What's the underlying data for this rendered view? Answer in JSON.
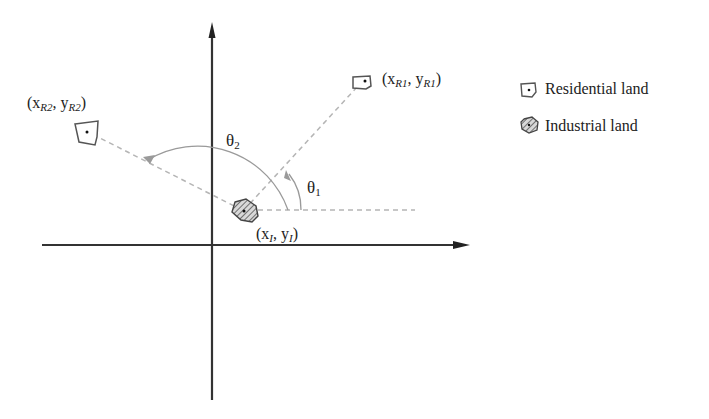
{
  "diagram": {
    "type": "coordinate-angle-diagram",
    "points": {
      "industrial": {
        "x_label": "x",
        "x_sub": "I",
        "y_label": "y",
        "y_sub": "I"
      },
      "residential_1": {
        "x_label": "x",
        "x_sub": "R1",
        "y_label": "y",
        "y_sub": "R1"
      },
      "residential_2": {
        "x_label": "x",
        "x_sub": "R2",
        "y_label": "y",
        "y_sub": "R2"
      }
    },
    "angles": {
      "theta1": {
        "symbol": "θ",
        "sub": "1"
      },
      "theta2": {
        "symbol": "θ",
        "sub": "2"
      }
    },
    "punct": {
      "open": "(",
      "comma": ", ",
      "close": ")"
    },
    "legend": {
      "items": [
        {
          "icon": "residential-land-icon",
          "label": "Residential land"
        },
        {
          "icon": "industrial-land-icon",
          "label": "Industrial land"
        }
      ]
    },
    "colors": {
      "axis": "#333333",
      "dashed": "#b5b5b5",
      "arc": "#9a9a9a",
      "icon_stroke": "#555555",
      "hatch": "#666666"
    }
  }
}
